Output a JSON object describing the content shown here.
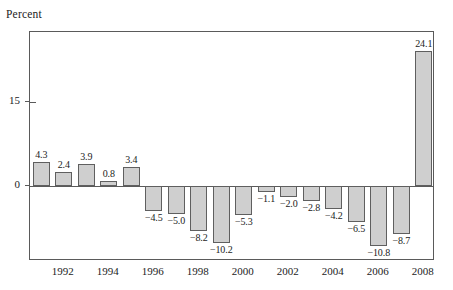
{
  "chart_data": {
    "type": "bar",
    "title": "",
    "subtitle": "",
    "xlabel": "",
    "ylabel": "Percent",
    "ylim": [
      -13.5,
      27.5
    ],
    "yticks": [
      0,
      15
    ],
    "ytick_labels": [
      "0",
      "15"
    ],
    "grid": false,
    "legend": null,
    "bar_color": "#cfcfcf",
    "bar_edge_color": "#5f5f5f",
    "axis_color": "#5a5a5a",
    "categories": [
      "1991",
      "1992",
      "1993",
      "1994",
      "1995",
      "1996",
      "1997",
      "1998",
      "1999",
      "2000",
      "2001",
      "2002",
      "2003",
      "2004",
      "2005",
      "2006",
      "2007",
      "2008"
    ],
    "xtick_labels": [
      "1992",
      "1994",
      "1996",
      "1998",
      "2000",
      "2002",
      "2004",
      "2006",
      "2008"
    ],
    "values": [
      4.3,
      2.4,
      3.9,
      0.8,
      3.4,
      -4.5,
      -5.0,
      -8.2,
      -10.2,
      -5.3,
      -1.1,
      -2.0,
      -2.8,
      -4.2,
      -6.5,
      -10.8,
      -8.7,
      24.1
    ],
    "data_labels": [
      "4.3",
      "2.4",
      "3.9",
      "0.8",
      "3.4",
      "−4.5",
      "−5.0",
      "−8.2",
      "−10.2",
      "−5.3",
      "−1.1",
      "−2.0",
      "−2.8",
      "−4.2",
      "−6.5",
      "−10.8",
      "−8.7",
      "24.1"
    ]
  }
}
